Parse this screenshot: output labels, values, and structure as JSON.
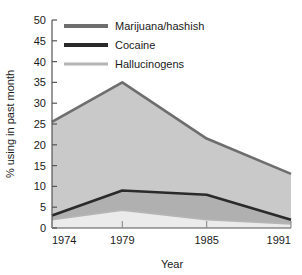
{
  "chart_data": {
    "type": "area",
    "title": "",
    "xlabel": "Year",
    "ylabel": "% using in past month",
    "x": [
      1974,
      1979,
      1985,
      1991
    ],
    "xtick_labels": [
      "1974",
      "1979",
      "1985",
      "1991"
    ],
    "ytick_labels": [
      "0",
      "5",
      "10",
      "15",
      "20",
      "25",
      "30",
      "35",
      "40",
      "45",
      "50"
    ],
    "ylim": [
      0,
      50
    ],
    "xlim": [
      1974,
      1991
    ],
    "ytick_step": 5,
    "grid": false,
    "stacked": false,
    "legend_position": "top-left",
    "series": [
      {
        "name": "Marijuana/hashish",
        "values": [
          25.5,
          35,
          21.5,
          13
        ],
        "line_color": "#6e6e6e",
        "fill_color": "#c9c9c9"
      },
      {
        "name": "Cocaine",
        "values": [
          3,
          9,
          8,
          2
        ],
        "line_color": "#2a2a2a",
        "fill_color": "#b0b0b0"
      },
      {
        "name": "Hallucinogens",
        "values": [
          2,
          4.3,
          2,
          1
        ],
        "line_color": "#b5b5b5",
        "fill_color": "#ebebeb"
      }
    ]
  },
  "axis": {
    "y_title": "% using in past month",
    "x_title": "Year",
    "axis_color": "#555555"
  },
  "legend": {
    "items": [
      {
        "label": "Marijuana/hashish",
        "color": "#6e6e6e"
      },
      {
        "label": "Cocaine",
        "color": "#2a2a2a"
      },
      {
        "label": "Hallucinogens",
        "color": "#b5b5b5"
      }
    ]
  },
  "yticks": [
    {
      "label": "50",
      "value": 50
    },
    {
      "label": "45",
      "value": 45
    },
    {
      "label": "40",
      "value": 40
    },
    {
      "label": "35",
      "value": 35
    },
    {
      "label": "30",
      "value": 30
    },
    {
      "label": "25",
      "value": 25
    },
    {
      "label": "20",
      "value": 20
    },
    {
      "label": "15",
      "value": 15
    },
    {
      "label": "10",
      "value": 10
    },
    {
      "label": "5",
      "value": 5
    },
    {
      "label": "0",
      "value": 0
    }
  ],
  "xticks": [
    {
      "label": "1974",
      "value": 1974
    },
    {
      "label": "1979",
      "value": 1979
    },
    {
      "label": "1985",
      "value": 1985
    },
    {
      "label": "1991",
      "value": 1991
    }
  ]
}
